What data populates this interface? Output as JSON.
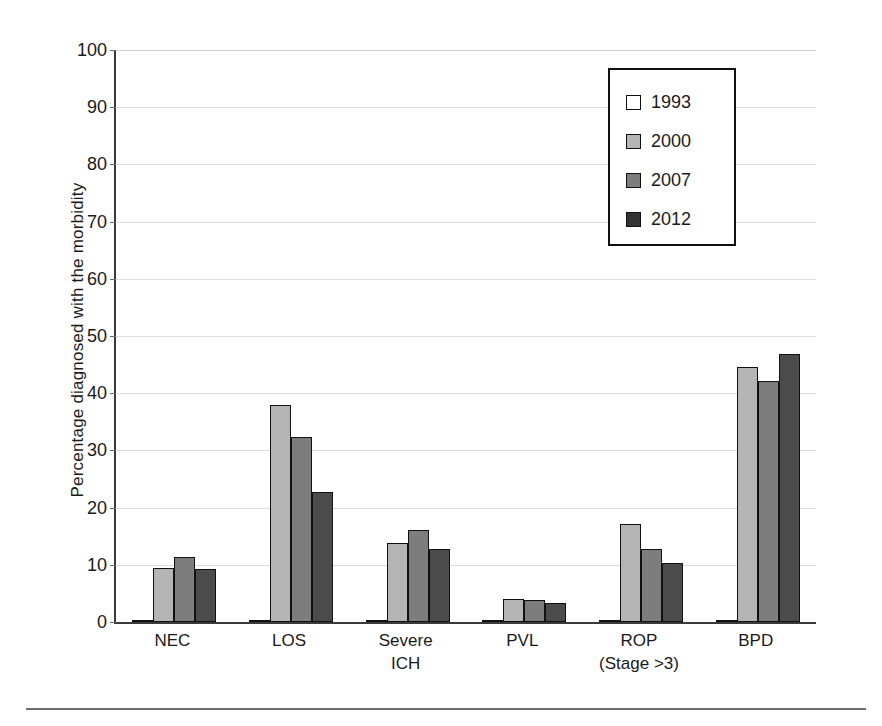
{
  "chart_data": {
    "type": "bar",
    "title": "",
    "xlabel": "",
    "ylabel": "Percentage diagnosed with the morbidity",
    "ylim": [
      0,
      100
    ],
    "ytick_step": 10,
    "yticks": [
      "100",
      "90",
      "80",
      "70",
      "60",
      "50",
      "40",
      "30",
      "20",
      "10",
      "0"
    ],
    "grid": true,
    "legend_position": "top-right",
    "categories": [
      "NEC",
      "LOS",
      "Severe ICH",
      "PVL",
      "ROP (Stage >3)",
      "BPD"
    ],
    "category_lines": [
      {
        "line1": "NEC",
        "line2": ""
      },
      {
        "line1": "LOS",
        "line2": ""
      },
      {
        "line1": "Severe",
        "line2": "ICH"
      },
      {
        "line1": "PVL",
        "line2": ""
      },
      {
        "line1": "ROP",
        "line2": "(Stage >3)"
      },
      {
        "line1": "BPD",
        "line2": ""
      }
    ],
    "series": [
      {
        "name": "1993",
        "color": "#ffffff",
        "values": [
          0.3,
          0.3,
          0.3,
          0.4,
          0.3,
          0.3
        ]
      },
      {
        "name": "2000",
        "color": "#b4b4b4",
        "values": [
          9.4,
          38.0,
          13.8,
          4.0,
          17.2,
          44.6
        ]
      },
      {
        "name": "2007",
        "color": "#7d7d7d",
        "values": [
          11.4,
          32.4,
          16.0,
          3.9,
          12.7,
          42.2
        ]
      },
      {
        "name": "2012",
        "color": "#4b4b4b",
        "values": [
          9.2,
          22.7,
          12.7,
          3.4,
          10.4,
          46.8
        ]
      }
    ]
  },
  "legend": {
    "items": [
      {
        "label": "1993"
      },
      {
        "label": "2000"
      },
      {
        "label": "2007"
      },
      {
        "label": "2012"
      }
    ]
  }
}
